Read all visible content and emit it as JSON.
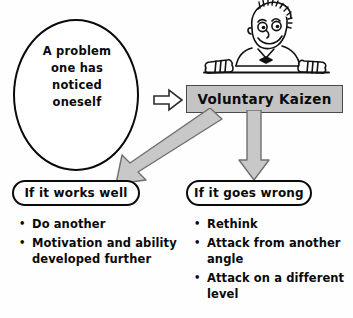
{
  "diagram": {
    "problem": {
      "text": "A problem\none has\nnoticed\noneself"
    },
    "kaizen": {
      "label": "Voluntary Kaizen"
    },
    "character": {
      "name": "smiling-man-behind-sign"
    },
    "branches": [
      {
        "pill_label": "If it works well",
        "bullets": [
          "Do another",
          "Motivation and ability developed further"
        ]
      },
      {
        "pill_label": "If it goes wrong",
        "bullets": [
          "Rethink",
          "Attack from another angle",
          "Attack on a different level"
        ]
      }
    ],
    "colors": {
      "outline": "#0a0a0a",
      "sign_fill": "#c4c4c4",
      "arrow_fill": "#c8c8c8",
      "arrow_stroke": "#6b6b6b",
      "background": "#fefefe"
    }
  }
}
